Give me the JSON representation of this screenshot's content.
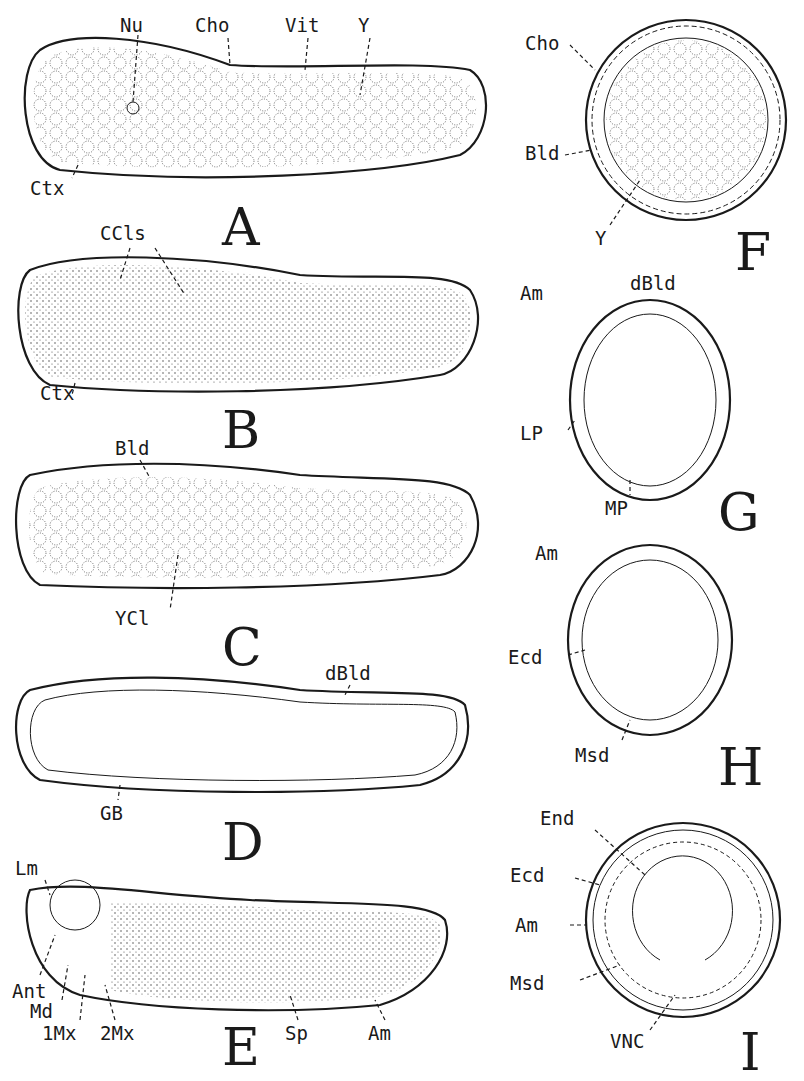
{
  "figure": {
    "panels": [
      {
        "id": "A",
        "letter": "A",
        "labels": [
          "Nu",
          "Cho",
          "Vit",
          "Y",
          "Ctx"
        ]
      },
      {
        "id": "B",
        "letter": "B",
        "labels": [
          "CCls",
          "Ctx"
        ]
      },
      {
        "id": "C",
        "letter": "C",
        "labels": [
          "Bld",
          "YCl"
        ]
      },
      {
        "id": "D",
        "letter": "D",
        "labels": [
          "dBld",
          "GB"
        ]
      },
      {
        "id": "E",
        "letter": "E",
        "labels": [
          "Lm",
          "Ant",
          "Md",
          "1Mx",
          "2Mx",
          "Sp",
          "Am"
        ]
      },
      {
        "id": "F",
        "letter": "F",
        "labels": [
          "Cho",
          "Bld",
          "Y"
        ]
      },
      {
        "id": "G",
        "letter": "G",
        "labels": [
          "Am",
          "dBld",
          "LP",
          "MP"
        ]
      },
      {
        "id": "H",
        "letter": "H",
        "labels": [
          "Am",
          "Ecd",
          "Msd"
        ]
      },
      {
        "id": "I",
        "letter": "I",
        "labels": [
          "End",
          "Ecd",
          "Am",
          "Msd",
          "VNC"
        ]
      }
    ]
  }
}
